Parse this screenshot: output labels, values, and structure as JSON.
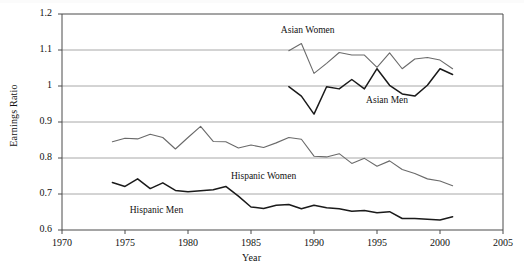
{
  "chart_data": {
    "type": "line",
    "title": "",
    "xlabel": "Year",
    "ylabel": "Earnings Ratio",
    "xlim": [
      1970,
      2005
    ],
    "ylim": [
      0.6,
      1.2
    ],
    "xticks": [
      1970,
      1975,
      1980,
      1985,
      1990,
      1995,
      2000,
      2005
    ],
    "yticks": [
      0.6,
      0.7,
      0.8,
      0.9,
      1.0,
      1.1,
      1.2
    ],
    "ytick_labels": [
      "0.6",
      "0.7",
      "0.8",
      "0.9",
      "1",
      "1.1",
      "1.2"
    ],
    "grid": "horizontal",
    "legend": "inline-annotations",
    "series": [
      {
        "name": "Asian Women",
        "color": "#6a6a6a",
        "width": 1.1,
        "label_x": 1989.5,
        "label_y": 1.152,
        "x": [
          1988,
          1989,
          1990,
          1991,
          1992,
          1993,
          1994,
          1995,
          1996,
          1997,
          1998,
          1999,
          2000,
          2001
        ],
        "values": [
          1.098,
          1.118,
          1.035,
          1.063,
          1.093,
          1.086,
          1.086,
          1.052,
          1.092,
          1.048,
          1.075,
          1.079,
          1.072,
          1.048
        ]
      },
      {
        "name": "Asian Men",
        "color": "#1a1a1a",
        "width": 1.5,
        "label_x": 1995.8,
        "label_y": 0.958,
        "x": [
          1988,
          1989,
          1990,
          1991,
          1992,
          1993,
          1994,
          1995,
          1996,
          1997,
          1998,
          1999,
          2000,
          2001
        ],
        "values": [
          0.998,
          0.972,
          0.922,
          0.998,
          0.992,
          1.018,
          0.992,
          1.048,
          1.002,
          0.978,
          0.972,
          1.002,
          1.048,
          1.032
        ]
      },
      {
        "name": "Hispanic Women",
        "color": "#6a6a6a",
        "width": 1.1,
        "label_x": 1986.0,
        "label_y": 0.748,
        "x": [
          1974,
          1975,
          1976,
          1977,
          1978,
          1979,
          1980,
          1981,
          1982,
          1983,
          1984,
          1985,
          1986,
          1987,
          1988,
          1989,
          1990,
          1991,
          1992,
          1993,
          1994,
          1995,
          1996,
          1997,
          1998,
          1999,
          2000,
          2001
        ],
        "values": [
          0.845,
          0.855,
          0.853,
          0.866,
          0.857,
          0.825,
          0.857,
          0.888,
          0.846,
          0.845,
          0.828,
          0.836,
          0.829,
          0.842,
          0.857,
          0.852,
          0.805,
          0.803,
          0.812,
          0.785,
          0.799,
          0.777,
          0.792,
          0.768,
          0.757,
          0.742,
          0.736,
          0.723
        ]
      },
      {
        "name": "Hispanic Men",
        "color": "#1a1a1a",
        "width": 1.5,
        "label_x": 1977.5,
        "label_y": 0.654,
        "x": [
          1974,
          1975,
          1976,
          1977,
          1978,
          1979,
          1980,
          1981,
          1982,
          1983,
          1984,
          1985,
          1986,
          1987,
          1988,
          1989,
          1990,
          1991,
          1992,
          1993,
          1994,
          1995,
          1996,
          1997,
          1998,
          1999,
          2000,
          2001
        ],
        "values": [
          0.732,
          0.721,
          0.742,
          0.715,
          0.731,
          0.71,
          0.706,
          0.709,
          0.712,
          0.721,
          0.694,
          0.664,
          0.66,
          0.669,
          0.671,
          0.659,
          0.669,
          0.662,
          0.659,
          0.652,
          0.654,
          0.648,
          0.651,
          0.632,
          0.632,
          0.63,
          0.628,
          0.637
        ]
      }
    ]
  },
  "axes": {
    "y_title": "Earnings Ratio",
    "x_title": "Year"
  }
}
